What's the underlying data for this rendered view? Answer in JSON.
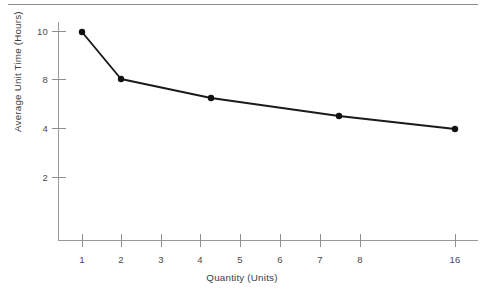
{
  "chart_data": {
    "type": "line",
    "title": "",
    "xlabel": "Quantity (Units)",
    "ylabel": "Average Unit Time (Hours)",
    "x_tick_labels": [
      "1",
      "2",
      "3",
      "4",
      "5",
      "6",
      "7",
      "8",
      "16"
    ],
    "y_tick_labels": [
      "2",
      "4",
      "8",
      "10"
    ],
    "x_scale": "log2",
    "y_scale": "nonlinear-ticks",
    "grid": false,
    "legend": null,
    "series": [
      {
        "name": "Average unit time",
        "points": [
          {
            "x": 1,
            "y": 10.1
          },
          {
            "x": 2,
            "y": 8.0
          },
          {
            "x": 4.25,
            "y": 6.5
          },
          {
            "x": 7.5,
            "y": 4.4
          },
          {
            "x": 16,
            "y": 3.9
          }
        ],
        "marker": "filled-circle",
        "color": "#111111"
      }
    ],
    "values": [
      10.1,
      8.0,
      6.5,
      4.4,
      3.9
    ],
    "categories": [
      "1",
      "2",
      "4.25",
      "7.5",
      "16"
    ],
    "xlim": [
      1,
      16
    ],
    "ylim": [
      0,
      10.8
    ]
  },
  "colors": {
    "line": "#111111",
    "axis": "#9a9a9a",
    "text": "#444444",
    "rule": "#8a8a8a",
    "background": "#ffffff"
  },
  "geometry": {
    "x_tick_px": [
      82,
      121,
      161,
      200,
      240,
      280,
      320,
      360,
      455
    ],
    "y_tick_px": [
      177,
      128,
      79,
      31
    ],
    "axis_origin_px": {
      "x": 58,
      "y": 240
    },
    "axis_top_px": 22,
    "axis_right_px": 478,
    "point_px": [
      {
        "x": 82,
        "y": 32
      },
      {
        "x": 121,
        "y": 79
      },
      {
        "x": 211,
        "y": 98
      },
      {
        "x": 339,
        "y": 116
      },
      {
        "x": 455,
        "y": 129
      }
    ]
  },
  "top_rule": {
    "visible": true
  }
}
